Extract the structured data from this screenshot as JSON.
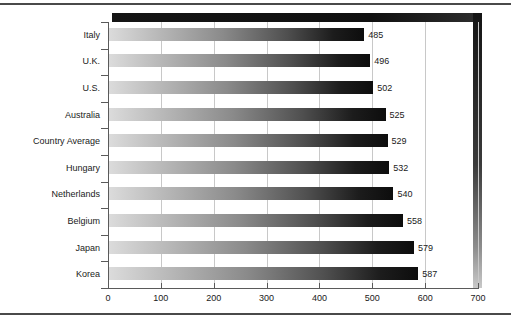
{
  "chart_data": {
    "type": "bar",
    "orientation": "horizontal",
    "title": "",
    "subtitle": "",
    "xlabel": "",
    "ylabel": "",
    "categories": [
      "Italy",
      "U.K.",
      "U.S.",
      "Australia",
      "Country Average",
      "Hungary",
      "Netherlands",
      "Belgium",
      "Japan",
      "Korea"
    ],
    "values": [
      485,
      496,
      502,
      525,
      529,
      532,
      540,
      558,
      579,
      587
    ],
    "data_labels": [
      "485",
      "496",
      "502",
      "525",
      "529",
      "532",
      "540",
      "558",
      "579",
      "587"
    ],
    "xlim": [
      0,
      700
    ],
    "xticks": [
      0,
      100,
      200,
      300,
      400,
      500,
      600,
      700
    ],
    "xtick_labels": [
      "0",
      "100",
      "200",
      "300",
      "400",
      "500",
      "600",
      "700"
    ],
    "grid": "vertical-only",
    "legend": "none",
    "bar_style": "horizontal-gradient light-to-dark",
    "colors": {
      "bar_gradient_start": "#dcdcdc",
      "bar_gradient_end": "#0d0d0d",
      "gridline": "#c8c8c8",
      "axis": "#5a5a5a",
      "wall_shadow": "#141414",
      "text": "#1a1a1a",
      "background": "#ffffff"
    }
  }
}
